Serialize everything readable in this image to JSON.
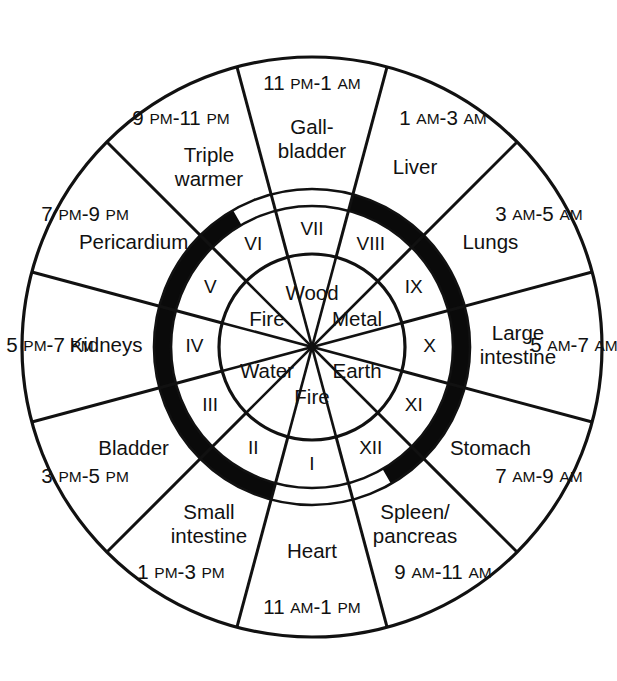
{
  "diagram": {
    "center": {
      "x": 312,
      "y": 347
    },
    "radii": {
      "outer": 290,
      "outer_ring_inner": 158,
      "band_outer": 158,
      "band_inner": 141,
      "roman_outer": 138,
      "roman_inner": 93,
      "element_outer": 93
    },
    "colors": {
      "stroke": "#111111",
      "band": "#0a0a0a",
      "background": "#ffffff"
    }
  },
  "chart_data": {
    "type": "pie",
    "xlabel": "",
    "ylabel": "",
    "sectors": 12,
    "sector_degrees": 30,
    "outer_ring": {
      "name": "Organ / two-hour period",
      "items": [
        {
          "roman": "I",
          "organ": "Heart",
          "organ_line1": "Heart",
          "organ_line2": "",
          "time": "11 AM-1 PM",
          "time_start_num": "11",
          "time_start_mer": "AM",
          "time_end_num": "1",
          "time_end_mer": "PM",
          "mid_angle_deg": 180
        },
        {
          "roman": "II",
          "organ": "Small intestine",
          "organ_line1": "Small",
          "organ_line2": "intestine",
          "time": "1 PM-3 PM",
          "time_start_num": "1",
          "time_start_mer": "PM",
          "time_end_num": "3",
          "time_end_mer": "PM",
          "mid_angle_deg": 210
        },
        {
          "roman": "III",
          "organ": "Bladder",
          "organ_line1": "Bladder",
          "organ_line2": "",
          "time": "3 PM-5 PM",
          "time_start_num": "3",
          "time_start_mer": "PM",
          "time_end_num": "5",
          "time_end_mer": "PM",
          "mid_angle_deg": 240
        },
        {
          "roman": "IV",
          "organ": "Kidneys",
          "organ_line1": "Kidneys",
          "organ_line2": "",
          "time": "5 PM-7 PM",
          "time_start_num": "5",
          "time_start_mer": "PM",
          "time_end_num": "7",
          "time_end_mer": "PM",
          "mid_angle_deg": 270
        },
        {
          "roman": "V",
          "organ": "Pericardium",
          "organ_line1": "Pericardium",
          "organ_line2": "",
          "time": "7 PM-9 PM",
          "time_start_num": "7",
          "time_start_mer": "PM",
          "time_end_num": "9",
          "time_end_mer": "PM",
          "mid_angle_deg": 300
        },
        {
          "roman": "VI",
          "organ": "Triple warmer",
          "organ_line1": "Triple",
          "organ_line2": "warmer",
          "time": "9 PM-11 PM",
          "time_start_num": "9",
          "time_start_mer": "PM",
          "time_end_num": "11",
          "time_end_mer": "PM",
          "mid_angle_deg": 330
        },
        {
          "roman": "VII",
          "organ": "Gallbladder",
          "organ_line1": "Gall-",
          "organ_line2": "bladder",
          "time": "11 PM-1 AM",
          "time_start_num": "11",
          "time_start_mer": "PM",
          "time_end_num": "1",
          "time_end_mer": "AM",
          "mid_angle_deg": 0
        },
        {
          "roman": "VIII",
          "organ": "Liver",
          "organ_line1": "Liver",
          "organ_line2": "",
          "time": "1 AM-3 AM",
          "time_start_num": "1",
          "time_start_mer": "AM",
          "time_end_num": "3",
          "time_end_mer": "AM",
          "mid_angle_deg": 30
        },
        {
          "roman": "IX",
          "organ": "Lungs",
          "organ_line1": "Lungs",
          "organ_line2": "",
          "time": "3 AM-5 AM",
          "time_start_num": "3",
          "time_start_mer": "AM",
          "time_end_num": "5",
          "time_end_mer": "AM",
          "mid_angle_deg": 60
        },
        {
          "roman": "X",
          "organ": "Large intestine",
          "organ_line1": "Large",
          "organ_line2": "intestine",
          "time": "5 AM-7 AM",
          "time_start_num": "5",
          "time_start_mer": "AM",
          "time_end_num": "7",
          "time_end_mer": "AM",
          "mid_angle_deg": 90
        },
        {
          "roman": "XI",
          "organ": "Stomach",
          "organ_line1": "Stomach",
          "organ_line2": "",
          "time": "7 AM-9 AM",
          "time_start_num": "7",
          "time_start_mer": "AM",
          "time_end_num": "9",
          "time_end_mer": "AM",
          "mid_angle_deg": 120
        },
        {
          "roman": "XII",
          "organ": "Spleen/pancreas",
          "organ_line1": "Spleen/",
          "organ_line2": "pancreas",
          "time": "9 AM-11 AM",
          "time_start_num": "9",
          "time_start_mer": "AM",
          "time_end_num": "11",
          "time_end_mer": "AM",
          "mid_angle_deg": 150
        }
      ]
    },
    "roman_ring": {
      "name": "Roman numeral hour index",
      "labels": [
        "I",
        "II",
        "III",
        "IV",
        "V",
        "VI",
        "VII",
        "VIII",
        "IX",
        "X",
        "XI",
        "XII"
      ]
    },
    "element_ring": {
      "name": "Five elements (wu xing)",
      "items": [
        {
          "label": "Fire",
          "mid_angle_deg": 180
        },
        {
          "label": "Water",
          "mid_angle_deg": 240
        },
        {
          "label": "Fire",
          "mid_angle_deg": 300
        },
        {
          "label": "Wood",
          "mid_angle_deg": 0
        },
        {
          "label": "Metal",
          "mid_angle_deg": 60
        },
        {
          "label": "Earth",
          "mid_angle_deg": 120
        }
      ]
    },
    "highlight_band": {
      "name": "black emphasis arc",
      "color": "#0a0a0a",
      "segments": [
        {
          "from_deg": 15,
          "to_deg": 150,
          "note": "right side, VIII through XII"
        },
        {
          "from_deg": 195,
          "to_deg": 330,
          "note": "left side, II through VI"
        }
      ]
    }
  }
}
